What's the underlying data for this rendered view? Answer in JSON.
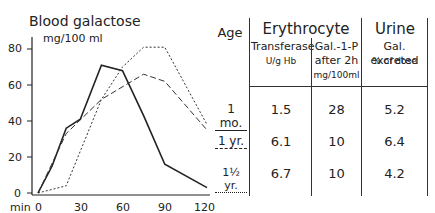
{
  "chart_data": {
    "type": "line",
    "title": "Blood galactose",
    "ylabel": "mg/100 ml",
    "xlabel": "min",
    "xticks": [
      0,
      30,
      60,
      90,
      120
    ],
    "yticks": [
      0,
      20,
      40,
      60,
      80
    ],
    "xlim": [
      0,
      120
    ],
    "ylim": [
      0,
      80
    ],
    "grid": false,
    "series": [
      {
        "name": "1 mo.",
        "style": "solid",
        "x": [
          0,
          10,
          20,
          30,
          45,
          60,
          75,
          90,
          120
        ],
        "y": [
          0,
          15,
          36,
          41,
          71,
          68,
          43,
          16,
          3
        ]
      },
      {
        "name": "1 yr.",
        "style": "dashed",
        "x": [
          0,
          20,
          45,
          75,
          90,
          120
        ],
        "y": [
          0,
          33,
          52,
          66,
          62,
          35
        ]
      },
      {
        "name": "1½ yr.",
        "style": "dotted",
        "x": [
          0,
          20,
          45,
          60,
          75,
          90,
          120
        ],
        "y": [
          0,
          4,
          52,
          70,
          81,
          81,
          38
        ]
      }
    ]
  },
  "chart_labels": {
    "title": "Blood galactose",
    "unit": "mg/100 ml",
    "x_unit": "min",
    "yticks": [
      "0",
      "20",
      "40",
      "60",
      "80"
    ],
    "xticks": [
      "0",
      "30",
      "60",
      "90",
      "120"
    ]
  },
  "table": {
    "col_age": "Age",
    "group_erythrocyte": "Erythrocyte",
    "group_urine": "Urine",
    "sub_transferase": "Transferase",
    "sub_transferase_unit": "U/g Hb",
    "sub_gal1p_1": "Gal.-1-P",
    "sub_gal1p_2": "after 2h",
    "sub_gal1p_unit": "mg/100ml",
    "sub_galexc": "Gal. excreted",
    "sub_galexc_unit": "% of dose",
    "rows": [
      {
        "age": "1 mo.",
        "transferase": "1.5",
        "gal1p": "28",
        "excreted": "5.2"
      },
      {
        "age": "1 yr.",
        "transferase": "6.1",
        "gal1p": "10",
        "excreted": "6.4"
      },
      {
        "age": "1½ yr.",
        "transferase": "6.7",
        "gal1p": "10",
        "excreted": "4.2"
      }
    ]
  }
}
